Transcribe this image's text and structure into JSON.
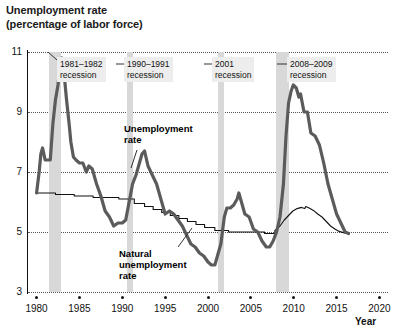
{
  "chart_data": {
    "type": "line",
    "title": "Unemployment rate\n(percentage of labor force)",
    "xlabel": "Year",
    "ylabel": "Unemployment rate (percentage of labor force)",
    "xlim": [
      1979,
      2021
    ],
    "ylim": [
      3,
      11
    ],
    "yticks": [
      3,
      5,
      7,
      9,
      11
    ],
    "xticks": [
      1980,
      1985,
      1990,
      1995,
      2000,
      2005,
      2010,
      2015,
      2020
    ],
    "grid": "horizontal-dotted",
    "legend": "inline-annotations",
    "series": [
      {
        "name": "Unemployment rate",
        "color": "#5b5b5b",
        "width": 3.2,
        "points": [
          [
            1980.0,
            6.3
          ],
          [
            1980.3,
            7.0
          ],
          [
            1980.5,
            7.6
          ],
          [
            1980.7,
            7.8
          ],
          [
            1981.0,
            7.4
          ],
          [
            1981.3,
            7.4
          ],
          [
            1981.6,
            7.4
          ],
          [
            1981.9,
            8.6
          ],
          [
            1982.2,
            9.4
          ],
          [
            1982.5,
            9.9
          ],
          [
            1982.8,
            10.7
          ],
          [
            1982.95,
            10.8
          ],
          [
            1983.2,
            10.3
          ],
          [
            1983.5,
            9.4
          ],
          [
            1983.8,
            8.6
          ],
          [
            1984.0,
            8.0
          ],
          [
            1984.3,
            7.5
          ],
          [
            1984.6,
            7.4
          ],
          [
            1985.0,
            7.3
          ],
          [
            1985.4,
            7.3
          ],
          [
            1985.8,
            7.0
          ],
          [
            1986.1,
            7.2
          ],
          [
            1986.5,
            7.1
          ],
          [
            1987.0,
            6.6
          ],
          [
            1987.5,
            6.2
          ],
          [
            1988.0,
            5.7
          ],
          [
            1988.5,
            5.5
          ],
          [
            1989.0,
            5.2
          ],
          [
            1989.5,
            5.3
          ],
          [
            1990.0,
            5.3
          ],
          [
            1990.4,
            5.4
          ],
          [
            1990.8,
            6.0
          ],
          [
            1991.2,
            6.6
          ],
          [
            1991.6,
            6.9
          ],
          [
            1992.0,
            7.3
          ],
          [
            1992.3,
            7.6
          ],
          [
            1992.6,
            7.7
          ],
          [
            1993.0,
            7.2
          ],
          [
            1993.5,
            6.9
          ],
          [
            1994.0,
            6.6
          ],
          [
            1994.5,
            6.1
          ],
          [
            1995.0,
            5.6
          ],
          [
            1995.5,
            5.7
          ],
          [
            1996.0,
            5.6
          ],
          [
            1996.5,
            5.4
          ],
          [
            1997.0,
            5.2
          ],
          [
            1997.5,
            4.9
          ],
          [
            1998.0,
            4.6
          ],
          [
            1998.5,
            4.5
          ],
          [
            1999.0,
            4.3
          ],
          [
            1999.5,
            4.2
          ],
          [
            2000.0,
            4.0
          ],
          [
            2000.4,
            3.9
          ],
          [
            2000.8,
            3.9
          ],
          [
            2001.1,
            4.2
          ],
          [
            2001.5,
            4.6
          ],
          [
            2001.9,
            5.5
          ],
          [
            2002.2,
            5.8
          ],
          [
            2002.6,
            5.8
          ],
          [
            2003.0,
            5.9
          ],
          [
            2003.4,
            6.1
          ],
          [
            2003.6,
            6.3
          ],
          [
            2003.9,
            6.0
          ],
          [
            2004.3,
            5.6
          ],
          [
            2004.8,
            5.5
          ],
          [
            2005.3,
            5.1
          ],
          [
            2005.8,
            5.0
          ],
          [
            2006.3,
            4.7
          ],
          [
            2006.8,
            4.5
          ],
          [
            2007.2,
            4.5
          ],
          [
            2007.6,
            4.7
          ],
          [
            2008.0,
            5.0
          ],
          [
            2008.4,
            5.5
          ],
          [
            2008.8,
            6.6
          ],
          [
            2009.1,
            8.2
          ],
          [
            2009.4,
            9.3
          ],
          [
            2009.7,
            9.7
          ],
          [
            2009.95,
            9.9
          ],
          [
            2010.3,
            9.8
          ],
          [
            2010.6,
            9.5
          ],
          [
            2010.8,
            9.6
          ],
          [
            2011.2,
            9.0
          ],
          [
            2011.6,
            9.0
          ],
          [
            2012.0,
            8.3
          ],
          [
            2012.5,
            8.2
          ],
          [
            2013.0,
            7.9
          ],
          [
            2013.5,
            7.3
          ],
          [
            2014.0,
            6.6
          ],
          [
            2014.5,
            6.1
          ],
          [
            2015.0,
            5.6
          ],
          [
            2015.5,
            5.3
          ],
          [
            2016.0,
            5.0
          ],
          [
            2016.4,
            4.95
          ]
        ]
      },
      {
        "name": "Natural unemployment rate",
        "color": "#111111",
        "width": 1.1,
        "points": [
          [
            1980.0,
            6.3
          ],
          [
            1982.2,
            6.3
          ],
          [
            1982.2,
            6.25
          ],
          [
            1984.4,
            6.25
          ],
          [
            1984.4,
            6.2
          ],
          [
            1986.6,
            6.2
          ],
          [
            1986.6,
            6.15
          ],
          [
            1989.6,
            6.15
          ],
          [
            1989.6,
            6.1
          ],
          [
            1991.4,
            6.1
          ],
          [
            1991.4,
            5.95
          ],
          [
            1992.6,
            5.95
          ],
          [
            1992.6,
            5.85
          ],
          [
            1993.6,
            5.85
          ],
          [
            1993.6,
            5.75
          ],
          [
            1994.6,
            5.75
          ],
          [
            1994.6,
            5.65
          ],
          [
            1995.6,
            5.65
          ],
          [
            1995.6,
            5.55
          ],
          [
            1996.6,
            5.55
          ],
          [
            1996.6,
            5.45
          ],
          [
            1997.6,
            5.45
          ],
          [
            1997.6,
            5.35
          ],
          [
            1998.6,
            5.35
          ],
          [
            1998.6,
            5.25
          ],
          [
            1999.6,
            5.25
          ],
          [
            1999.6,
            5.15
          ],
          [
            2000.8,
            5.15
          ],
          [
            2000.8,
            5.05
          ],
          [
            2002.4,
            5.05
          ],
          [
            2002.4,
            5.0
          ],
          [
            2006.6,
            5.0
          ],
          [
            2006.6,
            4.95
          ],
          [
            2007.8,
            4.95
          ],
          [
            2007.8,
            5.05
          ],
          [
            2008.4,
            5.2
          ],
          [
            2008.9,
            5.4
          ],
          [
            2009.4,
            5.55
          ],
          [
            2009.9,
            5.7
          ],
          [
            2010.4,
            5.78
          ],
          [
            2010.9,
            5.82
          ],
          [
            2011.3,
            5.78
          ],
          [
            2011.4,
            5.85
          ],
          [
            2011.8,
            5.8
          ],
          [
            2012.3,
            5.72
          ],
          [
            2012.8,
            5.6
          ],
          [
            2013.3,
            5.5
          ],
          [
            2013.8,
            5.35
          ],
          [
            2014.3,
            5.2
          ],
          [
            2014.8,
            5.1
          ],
          [
            2015.3,
            5.02
          ],
          [
            2015.9,
            4.97
          ],
          [
            2016.4,
            4.95
          ]
        ]
      }
    ],
    "recession_bands": [
      {
        "label": "1981–1982\nrecession",
        "start": 1981.5,
        "end": 1982.9
      },
      {
        "label": "1990–1991\nrecession",
        "start": 1990.5,
        "end": 1991.3
      },
      {
        "label": "2001\nrecession",
        "start": 2001.2,
        "end": 2001.9
      },
      {
        "label": "2008–2009\nrecession",
        "start": 2007.95,
        "end": 2009.5
      }
    ],
    "annotations": [
      {
        "name": "unemployment-rate-label",
        "text": "Unemployment\nrate"
      },
      {
        "name": "natural-unemployment-rate-label",
        "text": "Natural\nunemployment\nrate"
      }
    ],
    "colors": {
      "unemployment_line": "#5b5b5b",
      "natural_line": "#111111",
      "recession_band": "#d8d8d8",
      "label_box": "#ededed",
      "gridline": "#555555",
      "axis": "#111111",
      "background": "#ffffff"
    }
  },
  "axes": {
    "y_tick_labels": [
      "11",
      "9",
      "7",
      "5",
      "3"
    ],
    "x_tick_labels": [
      "1980",
      "1985",
      "1990",
      "1995",
      "2000",
      "2005",
      "2010",
      "2015",
      "2020"
    ],
    "x_axis_title": "Year"
  },
  "recession_labels": {
    "r1": "1981–1982\nrecession",
    "r2": "1990–1991\nrecession",
    "r3": "2001\nrecession",
    "r4": "2008–2009\nrecession"
  },
  "series_labels": {
    "unemployment": "Unemployment\nrate",
    "natural": "Natural\nunemployment\nrate"
  }
}
